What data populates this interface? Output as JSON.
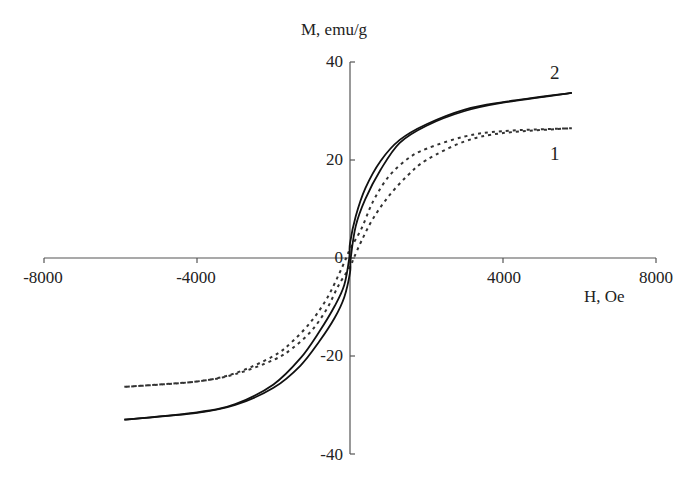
{
  "chart_data": {
    "type": "line",
    "title": "",
    "xlabel": "H, Oe",
    "ylabel": "M, emu/g",
    "xlim": [
      -8000,
      8000
    ],
    "ylim": [
      -40,
      40
    ],
    "xticks": [
      -8000,
      -4000,
      0,
      4000,
      8000
    ],
    "yticks": [
      -40,
      -20,
      0,
      20,
      40
    ],
    "xtick_labels": [
      "-8000",
      "-4000",
      "0",
      "4000",
      "8000"
    ],
    "ytick_labels": [
      "-40",
      "-20",
      "0",
      "20",
      "40"
    ],
    "grid": false,
    "legend": "inline curve labels",
    "series": [
      {
        "name": "1",
        "style": "dashed",
        "color": "#333333",
        "descending_branch": {
          "x": [
            5800,
            4000,
            3000,
            2000,
            1500,
            1000,
            600,
            300,
            0,
            -100,
            -300,
            -600,
            -1000,
            -1500,
            -2000,
            -3000,
            -4000,
            -5900
          ],
          "y": [
            26.5,
            25.9,
            24.8,
            22.3,
            20.2,
            16.5,
            11.5,
            6.0,
            1.8,
            0,
            -3.5,
            -8.2,
            -12.8,
            -17.0,
            -20.0,
            -23.5,
            -25.2,
            -26.3
          ]
        },
        "ascending_branch": {
          "x": [
            -5900,
            -4000,
            -3000,
            -2000,
            -1500,
            -1000,
            -600,
            -300,
            0,
            100,
            300,
            600,
            1000,
            1500,
            2000,
            3000,
            4000,
            5800
          ],
          "y": [
            -26.3,
            -25.2,
            -23.7,
            -20.8,
            -18.4,
            -14.8,
            -10.3,
            -5.6,
            -1.8,
            0,
            3.5,
            8.0,
            12.5,
            16.8,
            20.0,
            23.8,
            25.5,
            26.5
          ]
        }
      },
      {
        "name": "2",
        "style": "solid",
        "color": "#111111",
        "descending_branch": {
          "x": [
            5800,
            4000,
            3000,
            2000,
            1300,
            800,
            400,
            150,
            0,
            -20,
            -150,
            -400,
            -800,
            -1300,
            -2000,
            -3000,
            -4000,
            -5900
          ],
          "y": [
            33.7,
            31.8,
            30.3,
            27.3,
            24.1,
            19.8,
            14.2,
            8.5,
            3.0,
            0,
            -5.5,
            -9.8,
            -15.0,
            -20.5,
            -25.8,
            -29.8,
            -31.5,
            -33.0
          ]
        },
        "ascending_branch": {
          "x": [
            -5900,
            -4000,
            -3000,
            -2000,
            -1300,
            -800,
            -400,
            -150,
            0,
            20,
            150,
            400,
            800,
            1300,
            2000,
            3000,
            4000,
            5800
          ],
          "y": [
            -33.0,
            -31.6,
            -30.0,
            -26.5,
            -22.0,
            -17.0,
            -12.2,
            -8.0,
            -3.0,
            0,
            6.5,
            12.0,
            18.0,
            23.5,
            27.0,
            30.0,
            31.7,
            33.7
          ]
        }
      }
    ],
    "annotations": [
      {
        "text": "1",
        "x": 5400,
        "y": 20.3
      },
      {
        "text": "2",
        "x": 5400,
        "y": 37.8
      }
    ]
  },
  "labels": {
    "ylabel": "M, emu/g",
    "xlabel": "H, Oe",
    "curve1": "1",
    "curve2": "2",
    "xticks": [
      "-8000",
      "-4000",
      "0",
      "4000",
      "8000"
    ],
    "yticks": [
      "40",
      "20",
      "0",
      "-20",
      "-40"
    ]
  }
}
